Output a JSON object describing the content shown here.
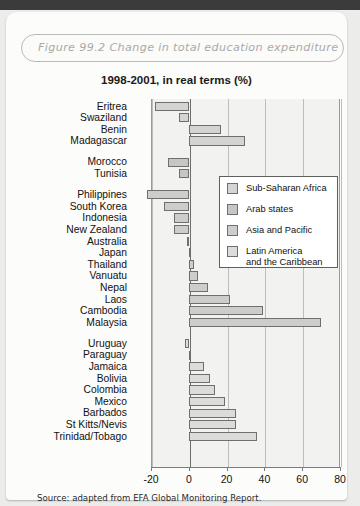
{
  "figure": {
    "caption": "Figure 99.2  Change in total education expenditure",
    "source": "Source: adapted from EFA Global Monitoring Report."
  },
  "chart_data": {
    "type": "bar",
    "orientation": "horizontal",
    "title": "1998-2001, in real terms (%)",
    "xlabel": "",
    "ylabel": "",
    "xlim": [
      -20,
      80
    ],
    "xticks": [
      -20,
      0,
      20,
      40,
      60,
      80
    ],
    "xticklabels": [
      "-20",
      "0",
      "20",
      "40",
      "60",
      "80"
    ],
    "grid": true,
    "legend_position": "center-right",
    "legend": [
      {
        "label": "Sub-Saharan Africa",
        "color": "#d4d4d2"
      },
      {
        "label": "Arab states",
        "color": "#c6c6c4"
      },
      {
        "label": "Asia and Pacific",
        "color": "#cdcdcb"
      },
      {
        "label": "Latin America\nand the Caribbean",
        "color": "#dcdcda"
      }
    ],
    "groups": [
      {
        "name": "Sub-Saharan Africa",
        "color": "#d4d4d2",
        "categories": [
          "Eritrea",
          "Swaziland",
          "Benin",
          "Madagascar"
        ],
        "values": [
          -18,
          -5,
          17,
          30
        ]
      },
      {
        "name": "Arab states",
        "color": "#c6c6c4",
        "categories": [
          "Morocco",
          "Tunisia"
        ],
        "values": [
          -11,
          -5
        ]
      },
      {
        "name": "Asia and Pacific",
        "color": "#cdcdcb",
        "categories": [
          "Philippines",
          "South Korea",
          "Indonesia",
          "New Zealand",
          "Australia",
          "Japan",
          "Thailand",
          "Vanuatu",
          "Nepal",
          "Laos",
          "Cambodia",
          "Malaysia"
        ],
        "values": [
          -22,
          -13,
          -8,
          -8,
          -1,
          1,
          3,
          5,
          10,
          22,
          39,
          70
        ]
      },
      {
        "name": "Latin America and the Caribbean",
        "color": "#dcdcda",
        "categories": [
          "Uruguay",
          "Paraguay",
          "Jamaica",
          "Bolivia",
          "Colombia",
          "Mexico",
          "Barbados",
          "St Kitts/Nevis",
          "Trinidad/Tobago"
        ],
        "values": [
          -2,
          1,
          8,
          11,
          14,
          19,
          25,
          25,
          36
        ]
      }
    ]
  }
}
